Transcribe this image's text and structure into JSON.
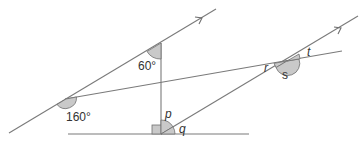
{
  "diagram": {
    "type": "geometry-angles",
    "labels": {
      "angle_60": "60°",
      "angle_160": "160°",
      "p": "p",
      "q": "q",
      "r": "r",
      "s": "s",
      "t": "t"
    },
    "colors": {
      "line": "#7a7a7a",
      "angle_fill": "#c9c9c9",
      "text": "#333333"
    },
    "notes": {
      "parallel_lines": "two lines marked with single arrows",
      "right_angle": "marked at foot of vertical line"
    }
  }
}
